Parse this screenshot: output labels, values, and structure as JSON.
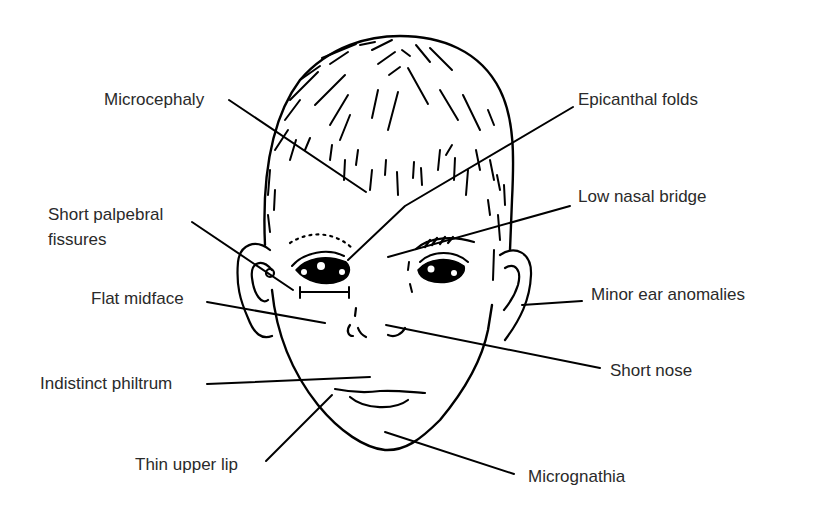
{
  "diagram": {
    "labels": {
      "microcephaly": "Microcephaly",
      "epicanthal_folds": "Epicanthal folds",
      "short_palpebral_line1": "Short palpebral",
      "short_palpebral_line2": "fissures",
      "low_nasal_bridge": "Low nasal bridge",
      "flat_midface": "Flat midface",
      "minor_ear_anomalies": "Minor ear anomalies",
      "short_nose": "Short nose",
      "indistinct_philtrum": "Indistinct philtrum",
      "thin_upper_lip": "Thin upper lip",
      "micrognathia": "Micrognathia"
    },
    "colors": {
      "ink": "#000000",
      "text": "#2a2a2a",
      "background": "#ffffff"
    }
  }
}
